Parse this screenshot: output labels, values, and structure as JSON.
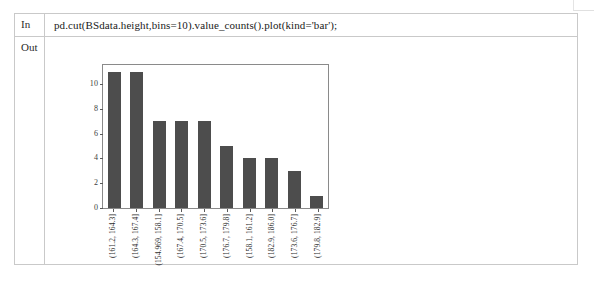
{
  "notebook": {
    "in_label": "In",
    "out_label": "Out",
    "code": "pd.cut(BSdata.height,bins=10).value_counts().plot(kind='bar');"
  },
  "colors": {
    "bar": "#4d4d4d",
    "axis": "#8a8a8a",
    "table_border": "#c9c9c9",
    "background": "#ffffff"
  },
  "chart_data": {
    "type": "bar",
    "title": "",
    "xlabel": "",
    "ylabel": "",
    "ylim": [
      0,
      11.55
    ],
    "yticks": [
      10,
      8,
      6,
      4,
      2,
      0
    ],
    "grid": false,
    "legend": null,
    "categories": [
      "(161.2, 164.3]",
      "(164.3, 167.4]",
      "(154.969, 158.1]",
      "(167.4, 170.5]",
      "(170.5, 173.6]",
      "(176.7, 179.8]",
      "(158.1, 161.2]",
      "(182.9, 186.0]",
      "(173.6, 176.7]",
      "(179.8, 182.9]"
    ],
    "values": [
      11,
      11,
      7,
      7,
      7,
      5,
      4,
      4,
      3,
      1
    ]
  }
}
